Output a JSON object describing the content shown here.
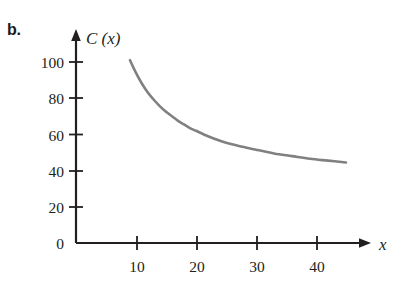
{
  "figure": {
    "part_label": "b.",
    "background_color": "#ffffff"
  },
  "chart_data": {
    "type": "line",
    "title": "",
    "subtitle": "",
    "xlabel": "x",
    "ylabel": "C (x)",
    "xlim": [
      0,
      47
    ],
    "ylim": [
      0,
      112
    ],
    "grid": false,
    "legend": "none",
    "axis_color": "#231f20",
    "curve_color": "#808080",
    "x_ticks": [
      10,
      20,
      30,
      40
    ],
    "x_tick_labels": [
      "10",
      "20",
      "30",
      "40"
    ],
    "y_ticks": [
      20,
      40,
      60,
      80,
      100
    ],
    "y_tick_labels": [
      "20",
      "40",
      "60",
      "80",
      "100"
    ],
    "y_origin_label": "0",
    "x_axis_arrow": true,
    "y_axis_arrow": true,
    "series": [
      {
        "name": "C (x)",
        "color": "#808080",
        "x": [
          9,
          10,
          11,
          12,
          13,
          14,
          15,
          16,
          17,
          18,
          19,
          20,
          22,
          24,
          26,
          28,
          30,
          33,
          36,
          39,
          42,
          45
        ],
        "y": [
          101,
          94,
          88,
          83,
          79,
          75.5,
          72.5,
          70,
          67.5,
          65.5,
          63.5,
          62,
          59,
          56.5,
          54.5,
          53,
          51.5,
          49.5,
          48,
          46.5,
          45.5,
          44.5
        ]
      }
    ],
    "annotations": []
  }
}
